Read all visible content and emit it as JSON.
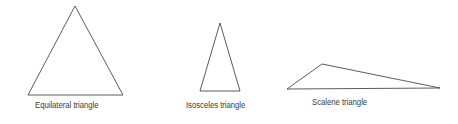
{
  "figure": {
    "background_color": "#ffffff",
    "stroke_color": "#4a4a4a",
    "text_color": "#3b3b3b",
    "width": 458,
    "height": 124
  },
  "shapes": [
    {
      "id": "equilateral",
      "name": "equilateral-triangle",
      "label": "Equilateral triangle",
      "points": "75,6 123,95 28,95",
      "vertices": [
        {
          "x": 75,
          "y": 6
        },
        {
          "x": 123,
          "y": 95
        },
        {
          "x": 28,
          "y": 95
        }
      ]
    },
    {
      "id": "isosceles",
      "name": "isosceles-triangle",
      "label": "Isosceles triangle",
      "points": "220,23 240,91 200,91",
      "vertices": [
        {
          "x": 220,
          "y": 23
        },
        {
          "x": 240,
          "y": 91
        },
        {
          "x": 200,
          "y": 91
        }
      ]
    },
    {
      "id": "scalene",
      "name": "scalene-triangle",
      "label": "Scalene triangle",
      "points": "322,64 440,88 287,89",
      "vertices": [
        {
          "x": 322,
          "y": 64
        },
        {
          "x": 440,
          "y": 88
        },
        {
          "x": 287,
          "y": 89
        }
      ]
    }
  ],
  "captions": {
    "equilateral": "Equilateral triangle",
    "isosceles": "Isosceles triangle",
    "scalene": "Scalene triangle"
  }
}
